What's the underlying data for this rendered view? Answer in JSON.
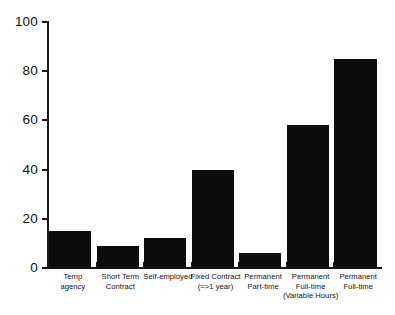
{
  "chart_data": {
    "type": "bar",
    "title": "",
    "subtitle": "",
    "xlabel": "",
    "ylabel": "",
    "ylim": [
      0,
      100
    ],
    "yticks": [
      0,
      20,
      40,
      60,
      80,
      100
    ],
    "grid": false,
    "legend": "none",
    "bar_color": "#0d0d0d",
    "categories": [
      "Temp agency",
      "Short Term Contract",
      "Self-employed",
      "Fixed Contract (=>1 year)",
      "Permanent Part-time",
      "Permanent Full-time (Variable Hours)",
      "Permanent Full-time"
    ],
    "category_lines": [
      [
        "Temp",
        "agency"
      ],
      [
        "Short Term",
        "Contract"
      ],
      [
        "Self-employed"
      ],
      [
        "Fixed Contract",
        "(=>1 year)"
      ],
      [
        "Permanent",
        "Part-time"
      ],
      [
        "Permanent",
        "Full-time",
        "(Variable Hours)"
      ],
      [
        "Permanent",
        "Full-time"
      ]
    ],
    "values": [
      15,
      9,
      12,
      40,
      6,
      58,
      85
    ]
  }
}
